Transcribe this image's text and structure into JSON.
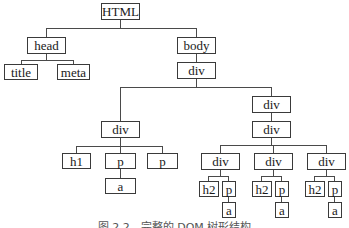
{
  "diagram": {
    "type": "tree",
    "nodes": {
      "html": "HTML",
      "head": "head",
      "body": "body",
      "title": "title",
      "meta": "meta",
      "body_div": "div",
      "left_div": "div",
      "left_h1": "h1",
      "left_p1": "p",
      "left_p1_a": "a",
      "left_p2": "p",
      "right_div": "div",
      "right_div_inner": "div",
      "col1_div": "div",
      "col1_h2": "h2",
      "col1_p": "p",
      "col1_a": "a",
      "col2_div": "div",
      "col2_h2": "h2",
      "col2_p": "p",
      "col2_a": "a",
      "col3_div": "div",
      "col3_h2": "h2",
      "col3_p": "p",
      "col3_a": "a"
    },
    "edges": [
      [
        "HTML",
        "head"
      ],
      [
        "HTML",
        "body"
      ],
      [
        "head",
        "title"
      ],
      [
        "head",
        "meta"
      ],
      [
        "body",
        "div"
      ],
      [
        "div",
        "div (left)"
      ],
      [
        "div",
        "div (right)"
      ],
      [
        "div (left)",
        "h1"
      ],
      [
        "div (left)",
        "p"
      ],
      [
        "div (left)",
        "p"
      ],
      [
        "p",
        "a"
      ],
      [
        "div (right)",
        "div (inner)"
      ],
      [
        "div (inner)",
        "div"
      ],
      [
        "div (inner)",
        "div"
      ],
      [
        "div (inner)",
        "div"
      ],
      [
        "div",
        "h2"
      ],
      [
        "div",
        "p"
      ],
      [
        "p",
        "a"
      ]
    ],
    "caption": "图 2.2　完整的 DOM 树形结构"
  }
}
